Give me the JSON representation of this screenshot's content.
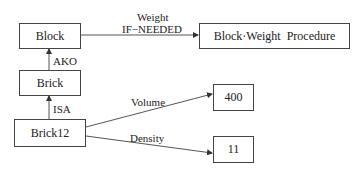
{
  "nodes": {
    "block": "Block",
    "brick": "Brick",
    "brick12": "Brick12",
    "procedure": "Block·Weight  Procedure",
    "volume_value": "400",
    "density_value": "11"
  },
  "edges": {
    "weight_slot": "Weight",
    "weight_facet": "IF−NEEDED",
    "ako": "AKO",
    "isa": "ISA",
    "volume": "Volume",
    "density": "Density"
  },
  "colors": {
    "line": "#444444",
    "text": "#222222",
    "background": "#ffffff"
  }
}
